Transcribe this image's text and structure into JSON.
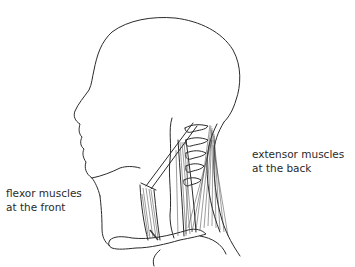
{
  "figure": {
    "labels": {
      "flexor": {
        "line1": "flexor muscles",
        "line2": "at the front"
      },
      "extensor": {
        "line1": "extensor muscles",
        "line2": "at the back"
      }
    },
    "colors": {
      "outline": "#2b2b2b",
      "muscle": "#3a3a3a",
      "text": "#2a2a2a",
      "background": "#ffffff"
    }
  }
}
